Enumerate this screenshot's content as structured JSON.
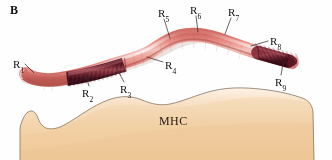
{
  "figure": {
    "panel_letter": "B",
    "mhc_label": "MHC",
    "residue_labels": [
      {
        "id": "R1",
        "text": "R",
        "sub": "1",
        "x": 13,
        "y": 59,
        "leader": {
          "x1": 25,
          "y1": 64,
          "x2": 34,
          "y2": 73
        }
      },
      {
        "id": "R2",
        "text": "R",
        "sub": "2",
        "x": 82,
        "y": 88,
        "leader": {
          "x1": 89,
          "y1": 86,
          "x2": 85,
          "y2": 73
        }
      },
      {
        "id": "R3",
        "text": "R",
        "sub": "3",
        "x": 120,
        "y": 84,
        "leader": {
          "x1": 124,
          "y1": 82,
          "x2": 116,
          "y2": 67
        }
      },
      {
        "id": "R4",
        "text": "R",
        "sub": "4",
        "x": 165,
        "y": 60,
        "leader": {
          "x1": 163,
          "y1": 62,
          "x2": 147,
          "y2": 57
        }
      },
      {
        "id": "R5",
        "text": "R",
        "sub": "5",
        "x": 158,
        "y": 8,
        "leader": {
          "x1": 164,
          "y1": 19,
          "x2": 170,
          "y2": 38
        }
      },
      {
        "id": "R6",
        "text": "R",
        "sub": "6",
        "x": 190,
        "y": 5,
        "leader": {
          "x1": 196,
          "y1": 16,
          "x2": 198,
          "y2": 32
        }
      },
      {
        "id": "R7",
        "text": "R",
        "sub": "7",
        "x": 228,
        "y": 7,
        "leader": {
          "x1": 231,
          "y1": 18,
          "x2": 225,
          "y2": 34
        }
      },
      {
        "id": "R8",
        "text": "R",
        "sub": "8",
        "x": 270,
        "y": 36,
        "leader": {
          "x1": 268,
          "y1": 41,
          "x2": 251,
          "y2": 46
        }
      },
      {
        "id": "R9",
        "text": "R",
        "sub": "9",
        "x": 275,
        "y": 77,
        "leader": {
          "x1": 281,
          "y1": 75,
          "x2": 283,
          "y2": 64
        }
      }
    ],
    "colors": {
      "peptide_pink": "#ef8d86",
      "peptide_pink_light": "#f8c3bb",
      "peptide_pink_dark": "#c9635c",
      "anchor_maroon": "#7d2434",
      "anchor_maroon_dark": "#4d1220",
      "anchor_maroon_light": "#9c3c48",
      "mhc_tan": "#f2cfa4",
      "mhc_tan_light": "#fbeedd",
      "mhc_outline": "#8b7a66",
      "text": "#1a1412",
      "background": "#ffffff"
    }
  }
}
